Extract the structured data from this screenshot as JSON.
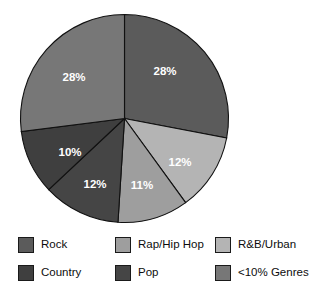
{
  "chart_data": {
    "type": "pie",
    "title": "",
    "subtitle": "",
    "xlabel": "",
    "ylabel": "",
    "grid": false,
    "legend_position": "bottom",
    "start_angle_deg": 0,
    "direction": "clockwise",
    "center": {
      "cx": 124.5,
      "cy": 118.5,
      "r": 104
    },
    "categories": [
      "Rock",
      "R&B/Urban",
      "Rap/Hip Hop",
      "Pop",
      "Country",
      "<10% Genres"
    ],
    "values": [
      28,
      12,
      11,
      12,
      10,
      28
    ],
    "value_unit": "%",
    "slices": [
      {
        "label": "Rock",
        "value": 28,
        "value_label": "28%",
        "color": "#5b5b5b",
        "start_deg": 0,
        "end_deg": 100.8,
        "label_x": 165,
        "label_y": 72
      },
      {
        "label": "R&B/Urban",
        "value": 12,
        "value_label": "12%",
        "color": "#b4b4b4",
        "start_deg": 100.8,
        "end_deg": 144.0,
        "label_x": 180,
        "label_y": 163
      },
      {
        "label": "Rap/Hip Hop",
        "value": 11,
        "value_label": "11%",
        "color": "#9e9e9e",
        "start_deg": 144.0,
        "end_deg": 183.6,
        "label_x": 142,
        "label_y": 186
      },
      {
        "label": "Pop",
        "value": 12,
        "value_label": "12%",
        "color": "#454545",
        "start_deg": 183.6,
        "end_deg": 226.8,
        "label_x": 95,
        "label_y": 185
      },
      {
        "label": "Country",
        "value": 10,
        "value_label": "10%",
        "color": "#3f3f3f",
        "start_deg": 226.8,
        "end_deg": 262.8,
        "label_x": 70,
        "label_y": 153
      },
      {
        "label": "<10% Genres",
        "value": 28,
        "value_label": "28%",
        "color": "#777777",
        "start_deg": 262.8,
        "end_deg": 360.0,
        "label_x": 74,
        "label_y": 78
      }
    ]
  },
  "legend": {
    "items": [
      {
        "label": "Rock",
        "color": "#5b5b5b"
      },
      {
        "label": "Rap/Hip Hop",
        "color": "#9e9e9e"
      },
      {
        "label": "R&B/Urban",
        "color": "#b4b4b4"
      },
      {
        "label": "Country",
        "color": "#3f3f3f"
      },
      {
        "label": "Pop",
        "color": "#454545"
      },
      {
        "label": "<10% Genres",
        "color": "#777777"
      }
    ]
  },
  "colors": {
    "background": "#ffffff",
    "slice_outline": "#111111",
    "slice_label_text": "#ffffff",
    "legend_text": "#0d0d0d",
    "legend_swatch_border": "#1a1a1a"
  }
}
